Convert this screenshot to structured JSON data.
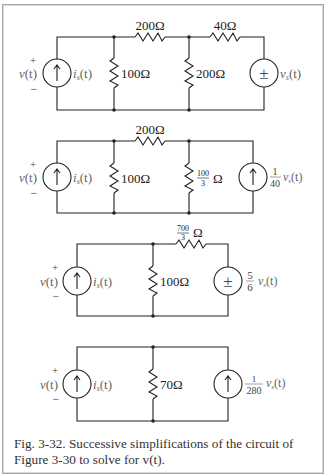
{
  "figure": {
    "caption_line1": "Fig. 3-32. Successive simplifications of the circuit of",
    "caption_line2": "Figure 3-30 to solve for v(t)."
  },
  "circuits": [
    {
      "id": "circuit-1",
      "left_source": {
        "type": "current",
        "label": "i_s(t)",
        "label_main": "i",
        "label_sub": "s",
        "label_arg": "(t)"
      },
      "voltage": {
        "label": "v(t)",
        "plus": "+",
        "minus": "−"
      },
      "series_resistor_1": "200Ω",
      "shunt_resistor_1": "100Ω",
      "shunt_resistor_2": "200Ω",
      "series_resistor_2": "40Ω",
      "right_source": {
        "type": "voltage",
        "symbol": "±",
        "label": "v_s(t)",
        "label_main": "v",
        "label_sub": "s",
        "label_arg": "(t)"
      }
    },
    {
      "id": "circuit-2",
      "left_source": {
        "type": "current",
        "label": "i_s(t)"
      },
      "voltage": {
        "label": "v(t)",
        "plus": "+",
        "minus": "−"
      },
      "series_resistor_1": "200Ω",
      "shunt_resistor_1": "100Ω",
      "shunt_resistor_2": {
        "num": "100",
        "den": "3",
        "unit": "Ω"
      },
      "right_source": {
        "type": "current",
        "coef_num": "1",
        "coef_den": "40",
        "label": "v_s(t)"
      }
    },
    {
      "id": "circuit-3",
      "left_source": {
        "type": "current",
        "label": "i_s(t)"
      },
      "voltage": {
        "label": "v(t)",
        "plus": "+",
        "minus": "−"
      },
      "shunt_resistor_1": "100Ω",
      "series_resistor_1": {
        "num": "700",
        "den": "3",
        "unit": "Ω"
      },
      "right_source": {
        "type": "voltage",
        "symbol": "±",
        "coef_num": "5",
        "coef_den": "6",
        "label": "v_s(t)"
      }
    },
    {
      "id": "circuit-4",
      "left_source": {
        "type": "current",
        "label": "i_s(t)"
      },
      "voltage": {
        "label": "v(t)",
        "plus": "+",
        "minus": "−"
      },
      "shunt_resistor_1": "70Ω",
      "right_source": {
        "type": "current",
        "coef_num": "1",
        "coef_den": "280",
        "label": "v_s(t)"
      }
    }
  ],
  "text": {
    "v": "v",
    "t": "(t)",
    "i": "i",
    "s": "s",
    "plus": "+",
    "minus": "−",
    "pm": "±",
    "r200": "200Ω",
    "r100": "100Ω",
    "r40": "40Ω",
    "r70": "70Ω",
    "n100": "100",
    "n700": "700",
    "d3": "3",
    "ohm": "Ω",
    "n1": "1",
    "d40": "40",
    "d280": "280",
    "n5": "5",
    "d6": "6"
  }
}
